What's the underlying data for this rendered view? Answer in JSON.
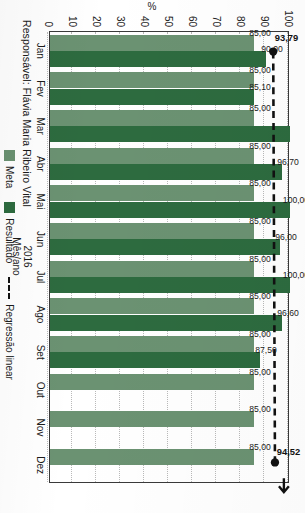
{
  "header": {
    "responsible_label": "Responsável: Flávia Maria Ribeiro Vital"
  },
  "legend": {
    "meta_label": "Meta",
    "resultado_label": "Resultado",
    "regression_label": "Regressão linear",
    "meta_color": "#6b9272",
    "resultado_color": "#2d6b3f",
    "regression_color": "#111111"
  },
  "axes": {
    "y_title": "%",
    "x_title": "Mês/ano",
    "x_year": "2016"
  },
  "chart_data": {
    "type": "bar",
    "title": "Responsável: Flávia Maria Ribeiro Vital",
    "xlabel": "Mês/ano",
    "ylabel": "%",
    "ylim": [
      0,
      100
    ],
    "yticks": [
      100,
      90,
      80,
      70,
      60,
      50,
      40,
      30,
      20,
      10,
      0
    ],
    "grid": true,
    "legend_position": "bottom",
    "categories": [
      "Jan",
      "Fev",
      "Mar",
      "Abr",
      "Mai",
      "Jun",
      "Jul",
      "Ago",
      "Set",
      "Out",
      "Nov",
      "Dez"
    ],
    "series": [
      {
        "name": "Meta",
        "color": "#6b9272",
        "values": [
          85.0,
          85.0,
          85.0,
          85.0,
          85.0,
          85.0,
          85.0,
          85.0,
          85.0,
          85.0,
          85.0,
          85.0
        ],
        "labels": [
          "85,00",
          "85,00",
          "85,00",
          "85,00",
          "85,00",
          "85,00",
          "85,00",
          "85,00",
          "85,00",
          "85,00",
          "85,00",
          "85,00"
        ]
      },
      {
        "name": "Resultado",
        "color": "#2d6b3f",
        "values": [
          90.0,
          85.1,
          100.0,
          96.7,
          100.0,
          96.0,
          100.0,
          96.6,
          87.5,
          null,
          null,
          null
        ],
        "labels": [
          "90,00",
          "85,10",
          "",
          "96,70",
          "100,00",
          "96,00",
          "100,00",
          "96,60",
          "87,50",
          "",
          "",
          ""
        ]
      }
    ],
    "annotations": [
      {
        "name": "regression-start",
        "category": "Jan",
        "value": 93.79,
        "label": "93,79"
      },
      {
        "name": "regression-end",
        "category": "Dez",
        "value": 94.52,
        "label": "94,52"
      }
    ],
    "regression": {
      "name": "Regressão linear",
      "style": "dashed",
      "from": {
        "category": "Jan",
        "value": 93.79
      },
      "to": {
        "category": "Dez",
        "value": 94.52
      }
    }
  }
}
